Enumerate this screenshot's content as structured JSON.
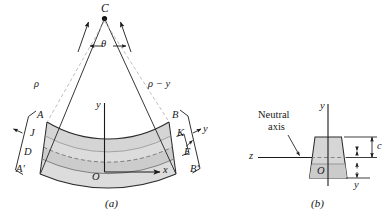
{
  "figure": {
    "type": "engineering-diagram",
    "background_color": "#ffffff",
    "ink_color": "#1a1a1a",
    "panels": [
      {
        "id": "a",
        "caption": "(a)",
        "title": "curved beam elevation"
      },
      {
        "id": "b",
        "caption": "(b)",
        "title": "trapezoidal cross section"
      }
    ]
  },
  "panel_a": {
    "center_of_curvature_label": "C",
    "angle_label": "θ",
    "radius_label": "ρ",
    "radius_minus_y_label": "ρ − y",
    "axis_y_label": "y",
    "axis_x_label": "x",
    "origin_label": "O",
    "left_face_labels": {
      "top": "A",
      "upper_mid": "J",
      "lower_mid": "D",
      "bottom": "A'"
    },
    "right_face_labels": {
      "top": "B",
      "upper_mid": "K",
      "lower_mid": "E",
      "bottom": "B'"
    },
    "bracket_left_label": "",
    "bracket_right_label": "y",
    "caption": "(a)",
    "shading": {
      "beam_fill": "#d8d8d8",
      "neutral_band_fill": "#cfcfcf",
      "stroke": "#2b2b2b",
      "dashed_stroke": "#8a8a8a"
    }
  },
  "panel_b": {
    "neutral_axis_label_line1": "Neutral",
    "neutral_axis_label_line2": "axis",
    "axis_y_label": "y",
    "axis_z_label": "z",
    "origin_label": "O",
    "dim_c_label": "c",
    "dim_y_label": "y",
    "caption": "(b)",
    "shading": {
      "section_fill": "#d4d4d4",
      "lower_fill": "#c9c9c9",
      "stroke": "#2b2b2b"
    }
  }
}
